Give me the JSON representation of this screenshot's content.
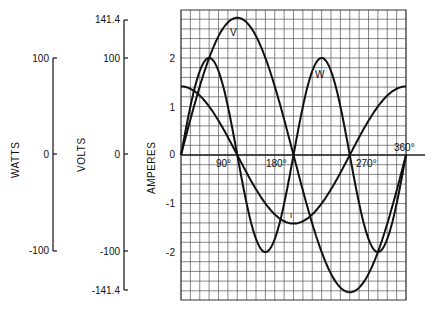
{
  "chart_data": {
    "type": "line",
    "title": "",
    "xlabel": "degrees",
    "ylabel": "AMPERES",
    "x_ticks": [
      "90°",
      "180°",
      "270°",
      "360°"
    ],
    "x_range": [
      0,
      360
    ],
    "grid": true,
    "axes": [
      {
        "name": "WATTS",
        "ticks": [
          "100",
          "0",
          "-100"
        ],
        "values": [
          100,
          0,
          -100
        ]
      },
      {
        "name": "VOLTS",
        "ticks": [
          "141.4",
          "100",
          "0",
          "-100",
          "-141.4"
        ],
        "values": [
          141.4,
          100,
          0,
          -100,
          -141.4
        ]
      },
      {
        "name": "AMPERES",
        "ticks": [
          "2",
          "1",
          "0",
          "-1",
          "-2"
        ],
        "values": [
          2,
          1,
          0,
          -1,
          -2
        ]
      }
    ],
    "series": [
      {
        "name": "V",
        "label": "V",
        "unit": "volts",
        "formula": "141.4*sin(x)",
        "x": [
          0,
          45,
          90,
          135,
          180,
          225,
          270,
          315,
          360
        ],
        "values": [
          0,
          100,
          141.4,
          100,
          0,
          -100,
          -141.4,
          -100,
          0
        ]
      },
      {
        "name": "I",
        "label": "I",
        "unit": "amperes",
        "formula": "1.414*cos(x)",
        "x": [
          0,
          45,
          90,
          135,
          180,
          225,
          270,
          315,
          360
        ],
        "values": [
          1.414,
          1,
          0,
          -1,
          -1.414,
          -1,
          0,
          1,
          1.414
        ]
      },
      {
        "name": "W",
        "label": "W",
        "unit": "watts",
        "formula": "100*sin(2x)",
        "x": [
          0,
          45,
          90,
          135,
          180,
          225,
          270,
          315,
          360
        ],
        "values": [
          0,
          100,
          0,
          -100,
          0,
          100,
          0,
          -100,
          0
        ]
      }
    ]
  },
  "labels": {
    "watts": "WATTS",
    "volts": "VOLTS",
    "amperes": "AMPERES",
    "watts_ticks": [
      "100",
      "0",
      "-100"
    ],
    "volts_ticks": [
      "141.4",
      "100",
      "0",
      "-100",
      "-141.4"
    ],
    "amp_ticks": [
      "2",
      "1",
      "0",
      "-1",
      "-2"
    ],
    "deg_ticks": [
      "90°",
      "180°",
      "270°",
      "360°"
    ],
    "curve_v": "V",
    "curve_w": "W",
    "curve_i": "I"
  }
}
